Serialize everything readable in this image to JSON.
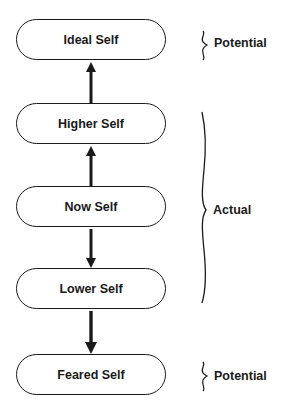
{
  "diagram": {
    "nodes": [
      {
        "id": "ideal",
        "label": "Ideal Self"
      },
      {
        "id": "higher",
        "label": "Higher Self"
      },
      {
        "id": "now",
        "label": "Now Self"
      },
      {
        "id": "lower",
        "label": "Lower Self"
      },
      {
        "id": "feared",
        "label": "Feared Self"
      }
    ],
    "edges": [
      {
        "from": "higher",
        "to": "ideal",
        "direction": "up"
      },
      {
        "from": "now",
        "to": "higher",
        "direction": "up"
      },
      {
        "from": "now",
        "to": "lower",
        "direction": "down"
      },
      {
        "from": "lower",
        "to": "feared",
        "direction": "down"
      }
    ],
    "groups": [
      {
        "label": "Potential",
        "covers": [
          "ideal"
        ]
      },
      {
        "label": "Actual",
        "covers": [
          "higher",
          "now",
          "lower"
        ]
      },
      {
        "label": "Potential",
        "covers": [
          "feared"
        ]
      }
    ]
  }
}
